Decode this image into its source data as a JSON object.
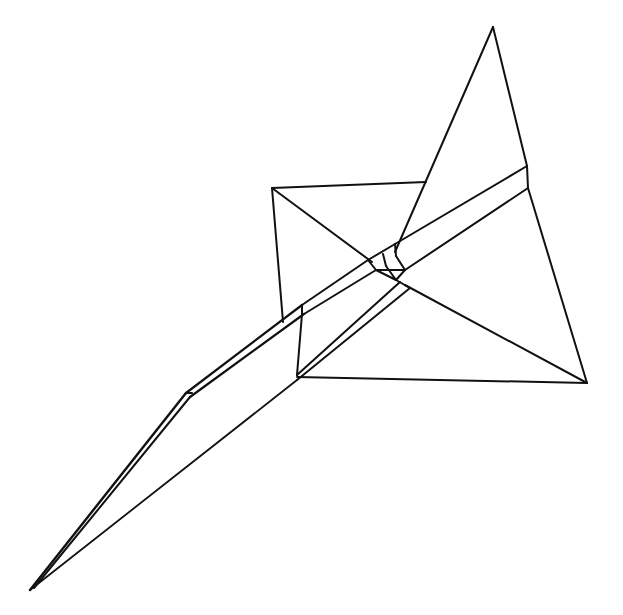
{
  "figure": {
    "type": "line-drawing",
    "stroke_color": "#111111",
    "background": "#ffffff"
  },
  "segments": [
    {
      "name": "tail-fin-left-edge",
      "x1": 493,
      "y1": 27,
      "x2": 395,
      "y2": 252,
      "w": 2
    },
    {
      "name": "tail-fin-right-edge",
      "x1": 493,
      "y1": 27,
      "x2": 527,
      "y2": 166,
      "w": 2
    },
    {
      "name": "tail-end-edge",
      "x1": 527,
      "y1": 166,
      "x2": 528,
      "y2": 188,
      "w": 2
    },
    {
      "name": "wing-trailing-right",
      "x1": 528,
      "y1": 188,
      "x2": 587,
      "y2": 383,
      "w": 2
    },
    {
      "name": "wing-diagonal-lower",
      "x1": 405,
      "y1": 285,
      "x2": 587,
      "y2": 383,
      "w": 2
    },
    {
      "name": "wing-bottom-edge",
      "x1": 297,
      "y1": 377,
      "x2": 587,
      "y2": 383,
      "w": 2
    },
    {
      "name": "box-top-edge",
      "x1": 272,
      "y1": 188,
      "x2": 426,
      "y2": 182,
      "w": 2
    },
    {
      "name": "box-left-edge",
      "x1": 272,
      "y1": 188,
      "x2": 283,
      "y2": 322,
      "w": 2
    },
    {
      "name": "box-diagonal",
      "x1": 272,
      "y1": 188,
      "x2": 372,
      "y2": 262,
      "w": 2
    },
    {
      "name": "fuselage-upper-top",
      "x1": 527,
      "y1": 166,
      "x2": 395,
      "y2": 244,
      "w": 2
    },
    {
      "name": "fuselage-upper-bottom",
      "x1": 528,
      "y1": 188,
      "x2": 405,
      "y2": 270,
      "w": 2
    },
    {
      "name": "body-upper-1",
      "x1": 368,
      "y1": 260,
      "x2": 302,
      "y2": 305,
      "w": 2
    },
    {
      "name": "body-upper-2",
      "x1": 376,
      "y1": 270,
      "x2": 304,
      "y2": 314,
      "w": 2
    },
    {
      "name": "body-step",
      "x1": 302,
      "y1": 305,
      "x2": 302,
      "y2": 314,
      "w": 2
    },
    {
      "name": "nose-upper-1",
      "x1": 302,
      "y1": 305,
      "x2": 186,
      "y2": 393,
      "w": 2.2
    },
    {
      "name": "nose-upper-2",
      "x1": 304,
      "y1": 314,
      "x2": 190,
      "y2": 397,
      "w": 2.2
    },
    {
      "name": "nose-vertical",
      "x1": 302,
      "y1": 314,
      "x2": 297,
      "y2": 375,
      "w": 2
    },
    {
      "name": "fuselage-lower-top",
      "x1": 400,
      "y1": 282,
      "x2": 297,
      "y2": 375,
      "w": 2
    },
    {
      "name": "fuselage-lower-bottom",
      "x1": 410,
      "y1": 288,
      "x2": 297,
      "y2": 380,
      "w": 2
    },
    {
      "name": "nose-lower-long",
      "x1": 297,
      "y1": 380,
      "x2": 30,
      "y2": 590,
      "w": 1.8
    },
    {
      "name": "nose-spike-1",
      "x1": 186,
      "y1": 393,
      "x2": 30,
      "y2": 590,
      "w": 2.4
    },
    {
      "name": "nose-spike-2",
      "x1": 190,
      "y1": 397,
      "x2": 34,
      "y2": 588,
      "w": 2
    },
    {
      "name": "nose-corner",
      "x1": 186,
      "y1": 393,
      "x2": 192,
      "y2": 393,
      "w": 2
    },
    {
      "name": "hub-1",
      "x1": 368,
      "y1": 260,
      "x2": 395,
      "y2": 244,
      "w": 2
    },
    {
      "name": "hub-2",
      "x1": 376,
      "y1": 270,
      "x2": 405,
      "y2": 270,
      "w": 2
    },
    {
      "name": "hub-3",
      "x1": 368,
      "y1": 260,
      "x2": 376,
      "y2": 270,
      "w": 2
    },
    {
      "name": "hub-4",
      "x1": 383,
      "y1": 254,
      "x2": 386,
      "y2": 266,
      "w": 2
    },
    {
      "name": "hub-5",
      "x1": 395,
      "y1": 244,
      "x2": 396,
      "y2": 256,
      "w": 2
    },
    {
      "name": "hub-6",
      "x1": 396,
      "y1": 256,
      "x2": 405,
      "y2": 270,
      "w": 2
    },
    {
      "name": "hub-7",
      "x1": 386,
      "y1": 266,
      "x2": 396,
      "y2": 280,
      "w": 2
    },
    {
      "name": "hub-8",
      "x1": 396,
      "y1": 280,
      "x2": 405,
      "y2": 270,
      "w": 2
    },
    {
      "name": "hub-9",
      "x1": 396,
      "y1": 280,
      "x2": 410,
      "y2": 288,
      "w": 2
    },
    {
      "name": "hub-10",
      "x1": 376,
      "y1": 270,
      "x2": 396,
      "y2": 280,
      "w": 2
    }
  ]
}
